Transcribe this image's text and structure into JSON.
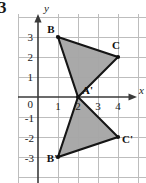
{
  "problem": {
    "number": "3"
  },
  "figure": {
    "axes": {
      "x_label": "x",
      "y_label": "y",
      "x_ticks": [
        "0",
        "1",
        "2",
        "3",
        "4"
      ],
      "y_ticks": [
        "3",
        "2",
        "1",
        "0",
        "-1",
        "-2",
        "-3"
      ],
      "origin_label": "0"
    },
    "grid": {
      "visible": true,
      "color": "#b8b8b8",
      "spacing_units": 1
    },
    "style": {
      "fill_color": "#a6a6a6",
      "stroke_color": "#1a1a1a",
      "axis_color": "#333333",
      "label_color": "#1a1a1a",
      "background": "#ffffff"
    },
    "shapes": [
      {
        "name": "triangle-preimage",
        "vertices": [
          {
            "label": "B",
            "x": 1,
            "y": 3
          },
          {
            "label": "C",
            "x": 4,
            "y": 2
          },
          {
            "label": "A'",
            "x": 2,
            "y": 0
          }
        ]
      },
      {
        "name": "triangle-image",
        "vertices": [
          {
            "label": "A'",
            "x": 2,
            "y": 0
          },
          {
            "label": "C'",
            "x": 4,
            "y": -2
          },
          {
            "label": "B'",
            "x": 1,
            "y": -3
          }
        ]
      }
    ],
    "point_labels": [
      {
        "name": "point-label-b",
        "text": "B",
        "x": 1,
        "y": 3
      },
      {
        "name": "point-label-c",
        "text": "C",
        "x": 4,
        "y": 2
      },
      {
        "name": "point-label-a-prime",
        "text": "A'",
        "x": 2,
        "y": 0
      },
      {
        "name": "point-label-c-prime",
        "text": "C'",
        "x": 4,
        "y": -2
      },
      {
        "name": "point-label-b-prime",
        "text": "B'",
        "x": 1,
        "y": -3
      }
    ]
  }
}
